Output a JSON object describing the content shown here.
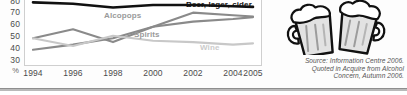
{
  "chart_data": {
    "type": "line",
    "title": "",
    "xlabel": "",
    "ylabel": "%",
    "x": [
      1994,
      1996,
      1998,
      2000,
      2002,
      2004,
      2005
    ],
    "categories": [
      "1994",
      "1996",
      "1998",
      "2000",
      "2002",
      "2004",
      "2005"
    ],
    "xtick_labels": [
      "1994",
      "1996",
      "1998",
      "2000",
      "2002",
      "2004",
      "2005"
    ],
    "ytick_labels": [
      "80",
      "70",
      "60",
      "50",
      "40",
      "30"
    ],
    "y_unit": "%",
    "ylim": [
      30,
      80
    ],
    "grid": false,
    "legend_position": "inline-labels",
    "series": [
      {
        "name": "Beer, lager, cider",
        "color": "#111111",
        "values": [
          75,
          74,
          71,
          73,
          73,
          72,
          71.5
        ]
      },
      {
        "name": "Alcopops",
        "color": "#8a8a8a",
        "values": [
          38,
          42,
          47,
          56,
          67,
          65,
          64
        ]
      },
      {
        "name": "Spirits",
        "color": "#8a8a8a",
        "values": [
          47,
          54,
          44,
          56,
          60,
          62,
          63.5
        ]
      },
      {
        "name": "Wine",
        "color": "#c8c8c8",
        "values": [
          47,
          41,
          49,
          45,
          44,
          42,
          43
        ]
      }
    ]
  },
  "series_labels": {
    "beer": "Beer, lager, cider",
    "alcopops": "Alcopops",
    "spirits": "Spirits",
    "wine": "Wine"
  },
  "source_note": {
    "line1": "Source: Information Centre 2006.",
    "line2": "Quoted in Acquire from Alcohol",
    "line3": "Concern, Autumn 2006."
  },
  "illustration": {
    "name": "beer-mugs-clipart",
    "description": "Two clinking beer mugs with foam"
  }
}
